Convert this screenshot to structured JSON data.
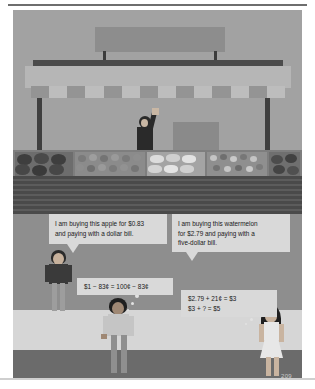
{
  "page": {
    "number": "209",
    "kind": "math-textbook-illustration"
  },
  "scene": {
    "name": "farmers-market-produce-stand",
    "sign_text": "",
    "vendor": {
      "name": "market-vendor",
      "gesture": "raised-arm-waving"
    },
    "bins": [
      {
        "name": "watermelon-bin",
        "produce": "watermelons"
      },
      {
        "name": "apple-bin",
        "produce": "apples"
      },
      {
        "name": "squash-bin",
        "produce": "squash"
      },
      {
        "name": "mixed-produce-bin",
        "produce": "mixed vegetables"
      },
      {
        "name": "melon-bin",
        "produce": "melons"
      }
    ]
  },
  "bubbles": {
    "left": {
      "speaker": "customer-buying-apple",
      "line1": "I am buying this apple for $0.83",
      "line2": "and paying with a dollar bill."
    },
    "right": {
      "speaker": "customer-buying-watermelon",
      "line1": "I am buying this watermelon",
      "line2": "for $2.79 and paying with a",
      "line3": "five-dollar bill."
    }
  },
  "equations": {
    "left": {
      "name": "apple-change-equation",
      "line1": "$1 − 83¢ = 100¢ − 83¢"
    },
    "right": {
      "name": "watermelon-change-equation",
      "line1": "$2.79 + 21¢ = $3",
      "line2": "$3 + ? = $5"
    }
  },
  "colors": {
    "sky": "#a2a2a2",
    "awning": "#b6b6b6",
    "counter_front": "#4a4a4a",
    "bubble_fill": "#d9d9d9",
    "text": "#1a1a1a",
    "ground": "#d6d6d6",
    "page_number": "#cdcdcd"
  }
}
